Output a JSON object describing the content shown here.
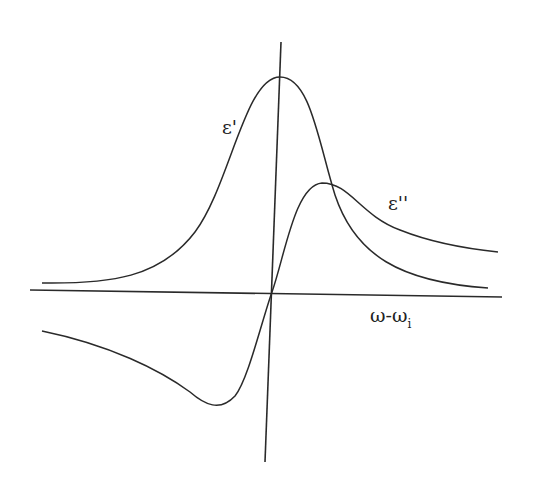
{
  "diagram": {
    "labels": {
      "eps_real": "ε'",
      "eps_imag": "ε''",
      "x_axis_main": "ω-ω",
      "x_axis_sub": "i"
    },
    "colors": {
      "line": "#2a2a2a",
      "background": "#ffffff"
    },
    "curves": [
      {
        "name": "epsilon-prime",
        "shape": "lorentzian-peak",
        "peak_at": "slightly right of origin"
      },
      {
        "name": "epsilon-double-prime",
        "shape": "dispersive",
        "min_left": true,
        "max_right": true
      }
    ]
  }
}
